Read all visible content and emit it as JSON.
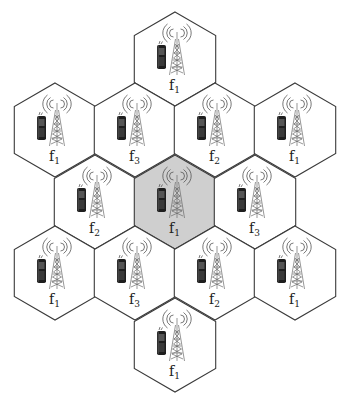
{
  "diagram": {
    "title": "",
    "hex_radius": 47,
    "colors": {
      "stroke": "#3a3a3a",
      "fill_default": "#ffffff",
      "fill_highlight": "#cfcfcf"
    },
    "cells": [
      {
        "id": "top",
        "cx": 175,
        "cy": 59,
        "freq": "f",
        "sub": "1",
        "highlight": false
      },
      {
        "id": "r2c1",
        "cx": 55,
        "cy": 130,
        "freq": "f",
        "sub": "1",
        "highlight": false
      },
      {
        "id": "r2c2",
        "cx": 135,
        "cy": 130,
        "freq": "f",
        "sub": "3",
        "highlight": false
      },
      {
        "id": "r2c3",
        "cx": 215,
        "cy": 130,
        "freq": "f",
        "sub": "2",
        "highlight": false
      },
      {
        "id": "r2c4",
        "cx": 295,
        "cy": 130,
        "freq": "f",
        "sub": "1",
        "highlight": false
      },
      {
        "id": "r3c1",
        "cx": 95,
        "cy": 202,
        "freq": "f",
        "sub": "2",
        "highlight": false
      },
      {
        "id": "center",
        "cx": 175,
        "cy": 202,
        "freq": "f",
        "sub": "1",
        "highlight": true
      },
      {
        "id": "r3c3",
        "cx": 255,
        "cy": 202,
        "freq": "f",
        "sub": "3",
        "highlight": false
      },
      {
        "id": "r4c1",
        "cx": 55,
        "cy": 273,
        "freq": "f",
        "sub": "1",
        "highlight": false
      },
      {
        "id": "r4c2",
        "cx": 135,
        "cy": 273,
        "freq": "f",
        "sub": "3",
        "highlight": false
      },
      {
        "id": "r4c3",
        "cx": 215,
        "cy": 273,
        "freq": "f",
        "sub": "2",
        "highlight": false
      },
      {
        "id": "r4c4",
        "cx": 295,
        "cy": 273,
        "freq": "f",
        "sub": "1",
        "highlight": false
      },
      {
        "id": "bottom",
        "cx": 175,
        "cy": 345,
        "freq": "f",
        "sub": "1",
        "highlight": false
      }
    ],
    "icons": {
      "tower": "cell-tower-icon",
      "phone": "mobile-phone-icon"
    }
  }
}
